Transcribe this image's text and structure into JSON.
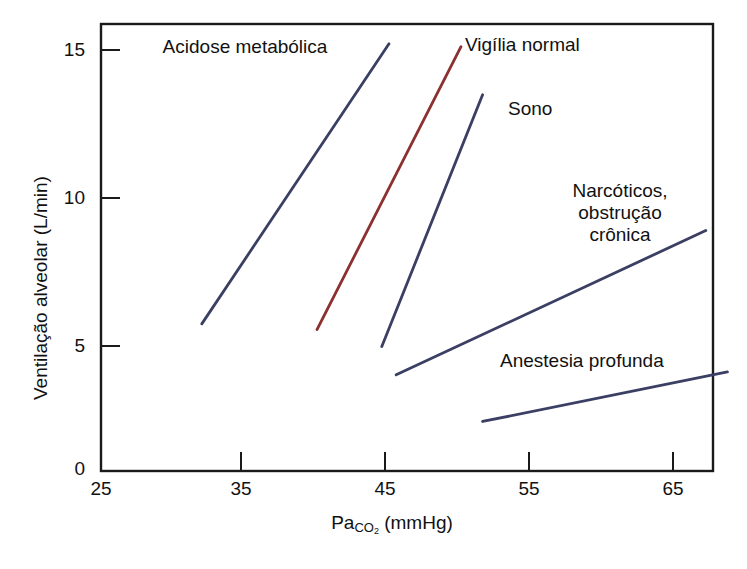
{
  "chart_data": {
    "type": "line",
    "title": "",
    "xlabel": "PaCO2 (mmHg)",
    "ylabel": "Ventilação alveolar (L/min)",
    "xlim": [
      25,
      67.5
    ],
    "ylim": [
      0,
      15.8
    ],
    "xticks": [
      "25",
      "35",
      "45",
      "55",
      "65"
    ],
    "xtick_values": [
      25,
      35,
      45,
      55,
      65
    ],
    "yticks": [
      "0",
      "5",
      "10",
      "15"
    ],
    "ytick_values": [
      0,
      5,
      10,
      15
    ],
    "grid": false,
    "legend_position": "inline-annotations",
    "series": [
      {
        "name": "Acidose metabólica",
        "color": "#3a3f63",
        "x": [
          32.0,
          45.0
        ],
        "y": [
          5.2,
          15.1
        ]
      },
      {
        "name": "Vigília normal",
        "color": "#8c3030",
        "x": [
          40.0,
          50.0
        ],
        "y": [
          5.0,
          15.0
        ]
      },
      {
        "name": "Sono",
        "color": "#3a3f63",
        "x": [
          44.5,
          51.5
        ],
        "y": [
          4.4,
          13.3
        ]
      },
      {
        "name": "Narcóticos, obstrução crônica",
        "color": "#3a3f63",
        "x": [
          45.5,
          67.0
        ],
        "y": [
          3.4,
          8.5
        ]
      },
      {
        "name": "Anestesia profunda",
        "color": "#3a3f63",
        "x": [
          51.5,
          68.5
        ],
        "y": [
          1.75,
          3.5
        ]
      }
    ],
    "annotations": [
      {
        "text": "Acidose metabólica",
        "x": 30.5,
        "y": 15.0
      },
      {
        "text": "Vigília normal",
        "x": 51.5,
        "y": 14.9
      },
      {
        "text": "Sono",
        "x": 54.0,
        "y": 12.9
      },
      {
        "text": "Narcóticos,\nobstrução crônica",
        "x": 60.0,
        "y": 10.3
      },
      {
        "text": "Anestesia profunda",
        "x": 61.5,
        "y": 4.5
      }
    ]
  },
  "axes": {
    "x_title_pre": "Pa",
    "x_title_sub": "CO",
    "x_title_sub2": "2",
    "x_title_post": " (mmHg)",
    "y_title": "Ventilação alveolar (L/min)"
  },
  "colors": {
    "axis": "#1a1a1a",
    "line_blue": "#3a3f63",
    "line_red": "#8c3030",
    "background": "#ffffff"
  }
}
